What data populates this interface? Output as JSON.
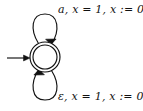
{
  "diagram": {
    "kind": "finite-state-automaton",
    "background_color": "#ffffff",
    "stroke_color": "#111111",
    "states": [
      {
        "id": "q0",
        "label": "",
        "accepting": true,
        "initial": true,
        "shape": "double-circle",
        "center_x": 45,
        "center_y": 57,
        "outer_radius": 15,
        "inner_radius": 12
      }
    ],
    "start_arrow": {
      "name": "start-arrow",
      "from_x": 7,
      "to_x": 30,
      "y": 58
    },
    "transitions": [
      {
        "id": "loop-top",
        "from": "q0",
        "to": "q0",
        "position": "above",
        "symbol": "a",
        "guard": "x = 1",
        "reset": "x := 0",
        "label": "a, x = 1, x := 0"
      },
      {
        "id": "loop-bottom",
        "from": "q0",
        "to": "q0",
        "position": "below",
        "symbol": "ε",
        "guard": "x = 1",
        "reset": "x := 0",
        "label": "ε, x = 1, x := 0"
      }
    ]
  }
}
